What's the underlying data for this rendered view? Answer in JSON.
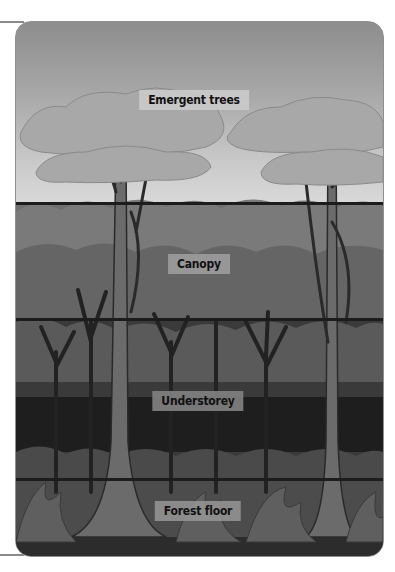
{
  "diagram": {
    "layers": [
      {
        "name": "emergent",
        "label": "Emergent trees"
      },
      {
        "name": "canopy",
        "label": "Canopy"
      },
      {
        "name": "understorey",
        "label": "Understorey"
      },
      {
        "name": "forest-floor",
        "label": "Forest floor"
      }
    ],
    "colors": {
      "sky_top": "#8d8d8d",
      "sky_bottom": "#d9d9d9",
      "canopy": "#6f6f6f",
      "understorey": "#2f2f2f",
      "floor": "#4a4a4a",
      "divider": "#1c1c1c",
      "label_bg": "#9a9a9a"
    }
  }
}
